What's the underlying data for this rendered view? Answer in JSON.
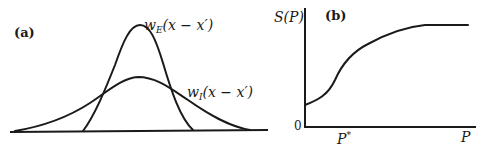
{
  "panel_a": {
    "tag": "(a)",
    "excitatory_label": {
      "w": "w",
      "sub": "E",
      "arg": "(x − x′)"
    },
    "inhibitory_label": {
      "w": "w",
      "sub": "I",
      "arg": "(x − x′)"
    }
  },
  "panel_b": {
    "tag": "(b)",
    "y_axis_label": "S(P)",
    "origin_label": "0",
    "x_tick_label": {
      "base": "P",
      "sup": "*"
    },
    "x_axis_label": "P"
  }
}
